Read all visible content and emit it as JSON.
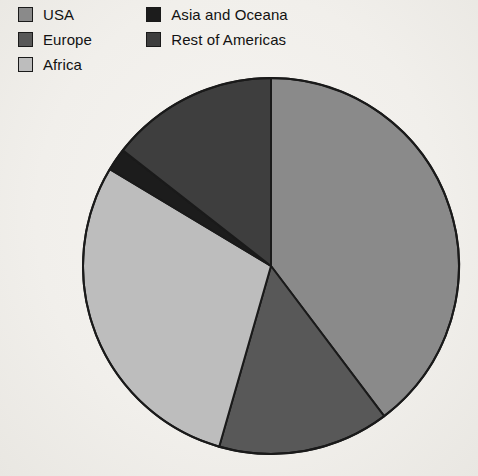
{
  "legend": {
    "columns": [
      {
        "items": [
          {
            "label": "USA",
            "color": "#8a8a8a",
            "swatch_name": "legend-swatch-usa"
          },
          {
            "label": "Europe",
            "color": "#585858",
            "swatch_name": "legend-swatch-europe"
          },
          {
            "label": "Africa",
            "color": "#bdbdbd",
            "swatch_name": "legend-swatch-africa"
          }
        ]
      },
      {
        "items": [
          {
            "label": "Asia and Oceana",
            "color": "#1c1c1c",
            "swatch_name": "legend-swatch-asia-and-oceana"
          },
          {
            "label": "Rest of Americas",
            "color": "#3e3e3e",
            "swatch_name": "legend-swatch-rest-of-americas"
          }
        ]
      }
    ]
  },
  "chart_data": {
    "type": "pie",
    "title": "",
    "subtitle": "",
    "xlabel": "",
    "ylabel": "",
    "legend_position": "top-left",
    "grid": false,
    "start_angle_deg": 0,
    "direction": "clockwise",
    "center": {
      "x": 271,
      "y": 266
    },
    "radius": 188,
    "stroke_color": "#1a1a1a",
    "stroke_width": 2,
    "categories": [
      "USA",
      "Europe",
      "Africa",
      "Asia and Oceana",
      "Rest of Americas"
    ],
    "values": [
      39.7,
      14.7,
      29.2,
      2.0,
      14.4
    ],
    "angles_deg": [
      143,
      53,
      105,
      7,
      52
    ],
    "colors": [
      "#8a8a8a",
      "#585858",
      "#bdbdbd",
      "#1c1c1c",
      "#3e3e3e"
    ],
    "slices": [
      {
        "label": "USA",
        "value": 39.7,
        "angle_deg": 143,
        "color": "#8a8a8a"
      },
      {
        "label": "Europe",
        "value": 14.7,
        "angle_deg": 53,
        "color": "#585858"
      },
      {
        "label": "Africa",
        "value": 29.2,
        "angle_deg": 105,
        "color": "#bdbdbd"
      },
      {
        "label": "Asia and Oceana",
        "value": 2.0,
        "angle_deg": 7,
        "color": "#1c1c1c"
      },
      {
        "label": "Rest of Americas",
        "value": 14.4,
        "angle_deg": 52,
        "color": "#3e3e3e"
      }
    ]
  }
}
